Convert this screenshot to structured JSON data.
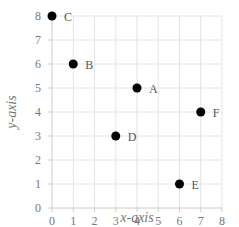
{
  "chart_data": {
    "type": "scatter",
    "title": "",
    "xlabel": "x-axis",
    "ylabel": "y-axis",
    "xlim": [
      0,
      8
    ],
    "ylim": [
      0,
      8
    ],
    "grid": true,
    "legend": "none",
    "x_ticks": [
      "0",
      "1",
      "2",
      "3",
      "4",
      "5",
      "6",
      "7",
      "8"
    ],
    "y_ticks": [
      "0",
      "1",
      "2",
      "3",
      "4",
      "5",
      "6",
      "7",
      "8"
    ],
    "points": [
      {
        "label": "C",
        "x": 0,
        "y": 8
      },
      {
        "label": "B",
        "x": 1,
        "y": 6
      },
      {
        "label": "A",
        "x": 4,
        "y": 5
      },
      {
        "label": "F",
        "x": 7,
        "y": 4
      },
      {
        "label": "D",
        "x": 3,
        "y": 3
      },
      {
        "label": "E",
        "x": 6,
        "y": 1
      }
    ],
    "marker_color": "#000000"
  }
}
